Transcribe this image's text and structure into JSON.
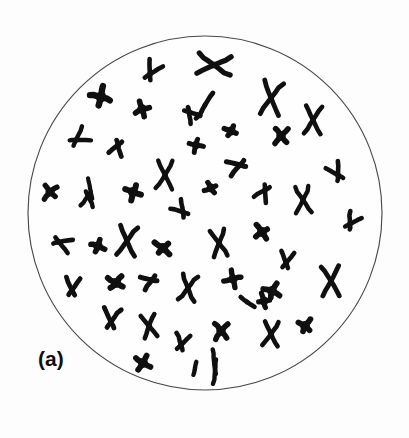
{
  "figure": {
    "panel_label": "(a)",
    "panel_label_x": 38,
    "panel_label_y": 348,
    "caption_text": "(a)",
    "background_color": "#fdfdfd",
    "chromosome_color": "#101010",
    "boundary_color": "#4a4a4a",
    "width": 409,
    "height": 438
  },
  "cell": {
    "name": "metaphase-spread-circle",
    "center_x": 205,
    "center_y": 213,
    "radius": 177,
    "stroke_width": 1.15
  },
  "chart_data": {
    "type": "scatter",
    "title": "(a)",
    "subtitle": "Metaphase chromosome spread",
    "xlabel": "",
    "ylabel": "",
    "xlim": [
      28,
      382
    ],
    "ylim": [
      36,
      390
    ],
    "grid": false,
    "legend": "none",
    "chromosome_count": 51,
    "shape_types": [
      "metacentric-x",
      "submetacentric-v",
      "acrocentric-v",
      "rod",
      "dot-blob"
    ],
    "annotations": [
      "(a)"
    ]
  },
  "chromosomes": [
    {
      "id": 1,
      "type": "submetacentric-v",
      "x": 150,
      "y": 74,
      "size": 15,
      "rot": 28,
      "w": 4.6
    },
    {
      "id": 2,
      "type": "metacentric-x",
      "x": 214,
      "y": 65,
      "size": 19,
      "rot": 96,
      "w": 5.2
    },
    {
      "id": 3,
      "type": "dot-blob",
      "x": 101,
      "y": 97,
      "size": 11,
      "rot": 15,
      "w": 6.4
    },
    {
      "id": 4,
      "type": "dot-blob",
      "x": 142,
      "y": 109,
      "size": 9,
      "rot": 70,
      "w": 5.6
    },
    {
      "id": 5,
      "type": "rod",
      "x": 205,
      "y": 105,
      "size": 16,
      "rot": 120,
      "w": 4.8
    },
    {
      "id": 6,
      "type": "submetacentric-v",
      "x": 189,
      "y": 112,
      "size": 12,
      "rot": 140,
      "w": 4.6
    },
    {
      "id": 7,
      "type": "metacentric-x",
      "x": 271,
      "y": 98,
      "size": 19,
      "rot": 8,
      "w": 4.8
    },
    {
      "id": 8,
      "type": "metacentric-x",
      "x": 313,
      "y": 120,
      "size": 16,
      "rot": 3,
      "w": 4.6
    },
    {
      "id": 9,
      "type": "submetacentric-v",
      "x": 76,
      "y": 140,
      "size": 15,
      "rot": 58,
      "w": 4.4
    },
    {
      "id": 10,
      "type": "submetacentric-v",
      "x": 118,
      "y": 145,
      "size": 12,
      "rot": 200,
      "w": 4.8
    },
    {
      "id": 11,
      "type": "dot-blob",
      "x": 231,
      "y": 131,
      "size": 8,
      "rot": 30,
      "w": 5.4
    },
    {
      "id": 12,
      "type": "dot-blob",
      "x": 196,
      "y": 145,
      "size": 8,
      "rot": 100,
      "w": 5.0
    },
    {
      "id": 13,
      "type": "dot-blob",
      "x": 281,
      "y": 136,
      "size": 10,
      "rot": 50,
      "w": 5.6
    },
    {
      "id": 14,
      "type": "metacentric-x",
      "x": 165,
      "y": 175,
      "size": 16,
      "rot": 2,
      "w": 4.4
    },
    {
      "id": 15,
      "type": "submetacentric-v",
      "x": 240,
      "y": 165,
      "size": 14,
      "rot": 255,
      "w": 5.0
    },
    {
      "id": 16,
      "type": "submetacentric-v",
      "x": 338,
      "y": 175,
      "size": 14,
      "rot": 330,
      "w": 4.6
    },
    {
      "id": 17,
      "type": "rod",
      "x": 90,
      "y": 188,
      "size": 11,
      "rot": 80,
      "w": 4.2
    },
    {
      "id": 18,
      "type": "submetacentric-v",
      "x": 88,
      "y": 196,
      "size": 12,
      "rot": 185,
      "w": 4.4
    },
    {
      "id": 19,
      "type": "dot-blob",
      "x": 50,
      "y": 192,
      "size": 9,
      "rot": 45,
      "w": 5.4
    },
    {
      "id": 20,
      "type": "dot-blob",
      "x": 133,
      "y": 192,
      "size": 10,
      "rot": 20,
      "w": 6.0
    },
    {
      "id": 21,
      "type": "dot-blob",
      "x": 211,
      "y": 188,
      "size": 8,
      "rot": 60,
      "w": 5.2
    },
    {
      "id": 22,
      "type": "submetacentric-v",
      "x": 265,
      "y": 190,
      "size": 13,
      "rot": 210,
      "w": 4.6
    },
    {
      "id": 23,
      "type": "metacentric-x",
      "x": 303,
      "y": 200,
      "size": 15,
      "rot": 355,
      "w": 4.4
    },
    {
      "id": 24,
      "type": "submetacentric-v",
      "x": 183,
      "y": 212,
      "size": 13,
      "rot": 320,
      "w": 4.6
    },
    {
      "id": 25,
      "type": "submetacentric-v",
      "x": 350,
      "y": 224,
      "size": 13,
      "rot": 30,
      "w": 4.6
    },
    {
      "id": 26,
      "type": "submetacentric-v",
      "x": 59,
      "y": 242,
      "size": 14,
      "rot": 110,
      "w": 4.6
    },
    {
      "id": 27,
      "type": "dot-blob",
      "x": 98,
      "y": 246,
      "size": 9,
      "rot": 25,
      "w": 5.6
    },
    {
      "id": 28,
      "type": "metacentric-x",
      "x": 127,
      "y": 241,
      "size": 17,
      "rot": 6,
      "w": 4.8
    },
    {
      "id": 29,
      "type": "dot-blob",
      "x": 163,
      "y": 248,
      "size": 10,
      "rot": 40,
      "w": 6.0
    },
    {
      "id": 30,
      "type": "metacentric-x",
      "x": 219,
      "y": 243,
      "size": 15,
      "rot": 352,
      "w": 4.6
    },
    {
      "id": 31,
      "type": "dot-blob",
      "x": 262,
      "y": 232,
      "size": 9,
      "rot": 55,
      "w": 5.8
    },
    {
      "id": 32,
      "type": "submetacentric-v",
      "x": 286,
      "y": 263,
      "size": 13,
      "rot": 10,
      "w": 4.6
    },
    {
      "id": 33,
      "type": "metacentric-x",
      "x": 331,
      "y": 281,
      "size": 17,
      "rot": 358,
      "w": 4.8
    },
    {
      "id": 34,
      "type": "submetacentric-v",
      "x": 72,
      "y": 290,
      "size": 14,
      "rot": 5,
      "w": 4.8
    },
    {
      "id": 35,
      "type": "dot-blob",
      "x": 116,
      "y": 283,
      "size": 10,
      "rot": 35,
      "w": 6.0
    },
    {
      "id": 36,
      "type": "submetacentric-v",
      "x": 152,
      "y": 280,
      "size": 12,
      "rot": 250,
      "w": 5.0
    },
    {
      "id": 37,
      "type": "metacentric-x",
      "x": 188,
      "y": 288,
      "size": 15,
      "rot": 8,
      "w": 4.6
    },
    {
      "id": 38,
      "type": "dot-blob",
      "x": 233,
      "y": 279,
      "size": 10,
      "rot": 70,
      "w": 5.4
    },
    {
      "id": 39,
      "type": "dot-blob",
      "x": 272,
      "y": 291,
      "size": 9,
      "rot": 20,
      "w": 5.8
    },
    {
      "id": 40,
      "type": "rod",
      "x": 247,
      "y": 302,
      "size": 9,
      "rot": 35,
      "w": 4.6
    },
    {
      "id": 41,
      "type": "submetacentric-v",
      "x": 111,
      "y": 322,
      "size": 16,
      "rot": 4,
      "w": 4.8
    },
    {
      "id": 42,
      "type": "metacentric-x",
      "x": 149,
      "y": 326,
      "size": 13,
      "rot": 350,
      "w": 4.6
    },
    {
      "id": 43,
      "type": "submetacentric-v",
      "x": 181,
      "y": 345,
      "size": 13,
      "rot": 15,
      "w": 4.6
    },
    {
      "id": 44,
      "type": "dot-blob",
      "x": 221,
      "y": 331,
      "size": 10,
      "rot": 45,
      "w": 5.6
    },
    {
      "id": 45,
      "type": "metacentric-x",
      "x": 271,
      "y": 334,
      "size": 14,
      "rot": 5,
      "w": 4.6
    },
    {
      "id": 46,
      "type": "dot-blob",
      "x": 305,
      "y": 326,
      "size": 9,
      "rot": 300,
      "w": 5.8
    },
    {
      "id": 47,
      "type": "rod",
      "x": 214,
      "y": 361,
      "size": 13,
      "rot": 84,
      "w": 4.4
    },
    {
      "id": 48,
      "type": "rod",
      "x": 215,
      "y": 371,
      "size": 13,
      "rot": 96,
      "w": 4.4
    },
    {
      "id": 49,
      "type": "rod",
      "x": 195,
      "y": 368,
      "size": 7,
      "rot": 100,
      "w": 4.4
    },
    {
      "id": 50,
      "type": "dot-blob",
      "x": 143,
      "y": 363,
      "size": 9,
      "rot": 25,
      "w": 5.8
    },
    {
      "id": 51,
      "type": "dot-blob",
      "x": 264,
      "y": 301,
      "size": 8,
      "rot": 80,
      "w": 5.2
    }
  ]
}
